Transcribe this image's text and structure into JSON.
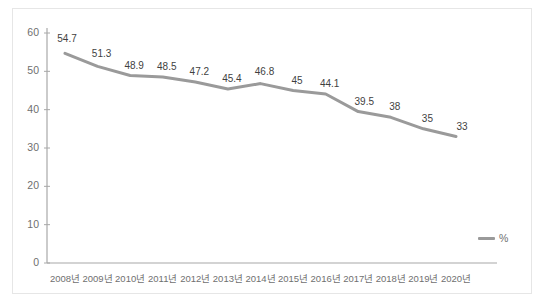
{
  "chart_data": {
    "type": "line",
    "title": "",
    "subtitle": "",
    "xlabel": "",
    "ylabel": "",
    "categories": [
      "2008년",
      "2009년",
      "2010년",
      "2011년",
      "2012년",
      "2013년",
      "2014년",
      "2015년",
      "2016년",
      "2017년",
      "2018년",
      "2019년",
      "2020년"
    ],
    "series": [
      {
        "name": "%",
        "values": [
          54.7,
          51.3,
          48.9,
          48.5,
          47.2,
          45.4,
          46.8,
          45,
          44.1,
          39.5,
          38,
          35,
          33
        ],
        "labels": [
          "54.7",
          "51.3",
          "48.9",
          "48.5",
          "47.2",
          "45.4",
          "46.8",
          "45",
          "44.1",
          "39.5",
          "38",
          "35",
          "33"
        ],
        "color": "#9a9a9a"
      }
    ],
    "ylim": [
      0,
      60
    ],
    "yticks": [
      0,
      10,
      20,
      30,
      40,
      50,
      60
    ],
    "ytick_labels": [
      "0",
      "10",
      "20",
      "30",
      "40",
      "50",
      "60"
    ],
    "grid": false,
    "legend": {
      "position": "bottom-right",
      "entries": [
        {
          "label": "%",
          "color": "#9a9a9a"
        }
      ]
    },
    "axis_color": "#a8a8a8",
    "data_label_color": "#3f3f3f",
    "tick_label_color": "#6f6f6f",
    "frame_color": "#e6e6e6",
    "background": "#ffffff"
  }
}
